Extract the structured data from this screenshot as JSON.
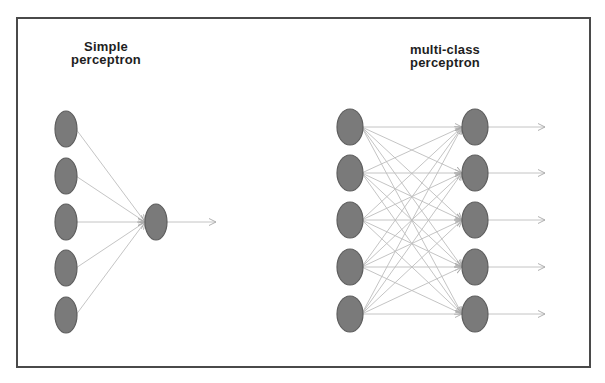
{
  "diagram": {
    "colors": {
      "frame": "#4a4a4a",
      "node_fill": "#7a7a7a",
      "node_stroke": "#5e5e5e",
      "edge": "#bdbdbd",
      "title_text": "#1e1e1e"
    },
    "simple_perceptron": {
      "title_line1": "Simple",
      "title_line2": "perceptron",
      "input_nodes": [
        {
          "cx": 66,
          "cy": 129
        },
        {
          "cx": 66,
          "cy": 176
        },
        {
          "cx": 66,
          "cy": 222
        },
        {
          "cx": 66,
          "cy": 268
        },
        {
          "cx": 66,
          "cy": 315
        }
      ],
      "output_nodes": [
        {
          "cx": 156,
          "cy": 222
        }
      ],
      "output_arrow_end_x": 216,
      "node_rx": 11,
      "node_ry": 18
    },
    "multi_class_perceptron": {
      "title_line1": "multi-class",
      "title_line2": "perceptron",
      "input_nodes": [
        {
          "cx": 350,
          "cy": 127
        },
        {
          "cx": 350,
          "cy": 173
        },
        {
          "cx": 350,
          "cy": 220
        },
        {
          "cx": 350,
          "cy": 267
        },
        {
          "cx": 350,
          "cy": 314
        }
      ],
      "output_nodes": [
        {
          "cx": 475,
          "cy": 127
        },
        {
          "cx": 475,
          "cy": 173
        },
        {
          "cx": 475,
          "cy": 220
        },
        {
          "cx": 475,
          "cy": 267
        },
        {
          "cx": 475,
          "cy": 314
        }
      ],
      "output_arrow_end_x": 545,
      "node_rx": 13,
      "node_ry": 18
    }
  }
}
